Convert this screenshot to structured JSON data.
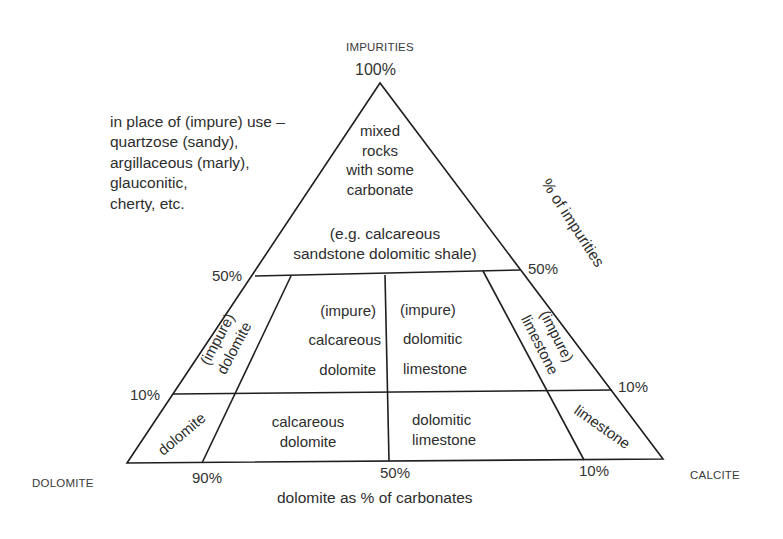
{
  "diagram": {
    "corners": {
      "top": "IMPURITIES",
      "top_value": "100%",
      "left": "DOLOMITE",
      "right": "CALCITE"
    },
    "note": {
      "lines": [
        "in place of (impure) use –",
        "quartzose (sandy),",
        "argillaceous (marly),",
        "glauconitic,",
        "cherty, etc."
      ]
    },
    "axes": {
      "right_side_title": "% of impurities",
      "bottom_title": "dolomite as % of carbonates",
      "left_ticks": {
        "fifty": "50%",
        "ten": "10%"
      },
      "right_ticks": {
        "fifty": "50%",
        "ten": "10%"
      },
      "bottom_ticks": {
        "ninety": "90%",
        "fifty": "50%",
        "ten": "10%"
      }
    },
    "regions": {
      "top": {
        "lines": [
          "mixed",
          "rocks",
          "with some",
          "carbonate"
        ],
        "example_lines": [
          "(e.g. calcareous",
          "sandstone dolomitic shale)"
        ]
      },
      "impure_dolomite": [
        "(impure)",
        "dolomite"
      ],
      "impure_calcareous_dolomite": [
        "(impure)",
        "calcareous",
        "dolomite"
      ],
      "impure_dolomitic_limestone": [
        "(impure)",
        "dolomitic",
        "limestone"
      ],
      "impure_limestone": [
        "(impure)",
        "limestone"
      ],
      "dolomite": "dolomite",
      "calcareous_dolomite": [
        "calcareous",
        "dolomite"
      ],
      "dolomitic_limestone": [
        "dolomitic",
        "limestone"
      ],
      "limestone": "limestone"
    },
    "colors": {
      "line": "#1e1e1e",
      "text": "#2d2d2d",
      "background": "#ffffff"
    }
  }
}
